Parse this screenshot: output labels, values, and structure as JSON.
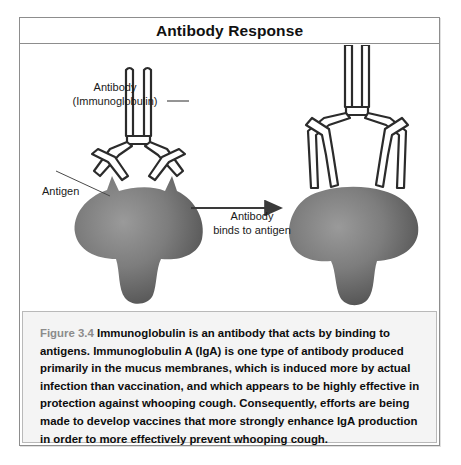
{
  "figure": {
    "title": "Antibody Response",
    "copyright": "© Infobase Publishing",
    "labels": {
      "antibody_line1": "Antibody",
      "antibody_line2": "(Immunoglobulin)",
      "antigen": "Antigen",
      "arrow_line1": "Antibody",
      "arrow_line2": "binds to antigen"
    },
    "caption": {
      "figure_number": "Figure 3.4",
      "body": " Immunoglobulin is an antibody that acts by binding to antigens. Immunoglobulin A (IgA) is one type of antibody produced primarily in the mucus membranes, which is induced more by actual infection than vaccination, and which appears to be highly effective in protection against whooping cough. Consequently, efforts are being made to develop vaccines that more strongly enhance IgA production in order to more effectively prevent whooping cough."
    },
    "colors": {
      "frame_border": "#8d8d8d",
      "antigen_fill_light": "#8e8e8e",
      "antigen_fill_dark": "#4f4f4f",
      "antibody_stroke": "#2b2b2b",
      "caption_background": "#f4f4f4",
      "figure_number_color": "#8b8b8b"
    },
    "icons": {
      "arrow": "right-arrow-icon",
      "antibody": "antibody-y-shape-icon",
      "antigen": "antigen-blob-icon"
    }
  }
}
